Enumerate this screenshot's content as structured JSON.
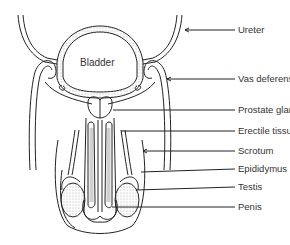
{
  "diagram": {
    "inner_label": "Bladder",
    "line_color": "#222222",
    "text_color": "#333333",
    "labels": [
      {
        "id": "ureter",
        "text": "Ureter",
        "y": 27
      },
      {
        "id": "vas-deferens",
        "text": "Vas deferens",
        "y": 76
      },
      {
        "id": "prostate-gland",
        "text": "Prostate gland",
        "y": 107
      },
      {
        "id": "erectile-tissue",
        "text": "Erectile tissue",
        "y": 128
      },
      {
        "id": "scrotum",
        "text": "Scrotum",
        "y": 148
      },
      {
        "id": "epididymus",
        "text": "Epididymus",
        "y": 166
      },
      {
        "id": "testis",
        "text": "Testis",
        "y": 184
      },
      {
        "id": "penis",
        "text": "Penis",
        "y": 204
      }
    ]
  }
}
